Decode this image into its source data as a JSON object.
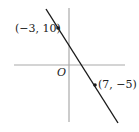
{
  "diagram": {
    "origin_label": "O",
    "points": [
      {
        "label": "(−3, 10)",
        "x": -3,
        "y": 10
      },
      {
        "label": "(7, −5)",
        "x": 7,
        "y": -5
      }
    ],
    "colors": {
      "axis": "#aaaaaa",
      "line": "#1a1a1a",
      "text": "#222222"
    }
  }
}
